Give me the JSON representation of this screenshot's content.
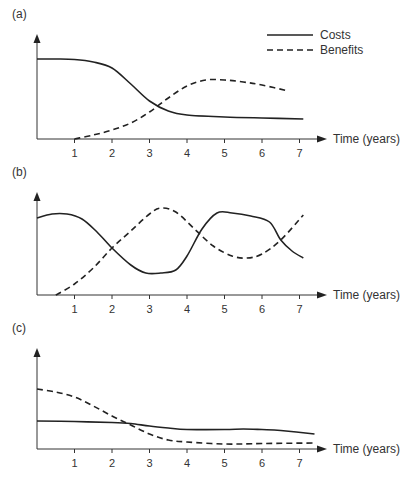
{
  "chart_data": [
    {
      "type": "line",
      "panel": "(a)",
      "xlabel": "Time (years)",
      "ylabel": "",
      "x_ticks": [
        1,
        2,
        3,
        4,
        5,
        6,
        7
      ],
      "legend": [
        "Costs",
        "Benefits"
      ],
      "legend_position": "top-right",
      "grid": false,
      "series": [
        {
          "name": "Costs",
          "style": "solid",
          "x": [
            0,
            0.5,
            1,
            1.5,
            2,
            2.5,
            3,
            3.5,
            4,
            5,
            6,
            7.1
          ],
          "y": [
            80,
            80,
            79.5,
            77,
            71,
            55,
            38,
            28,
            24,
            22,
            21,
            20
          ]
        },
        {
          "name": "Benefits",
          "style": "dashed",
          "x": [
            1,
            1.5,
            2,
            2.5,
            3,
            3.5,
            4,
            4.5,
            5,
            5.5,
            6,
            6.7
          ],
          "y": [
            0,
            4,
            9,
            16,
            27,
            41,
            53,
            59,
            59,
            57,
            54,
            48
          ]
        }
      ]
    },
    {
      "type": "line",
      "panel": "(b)",
      "xlabel": "Time (years)",
      "ylabel": "",
      "x_ticks": [
        1,
        2,
        3,
        4,
        5,
        6,
        7
      ],
      "grid": false,
      "series": [
        {
          "name": "Costs",
          "style": "solid",
          "x": [
            0,
            0.4,
            0.8,
            1.2,
            1.6,
            2,
            2.5,
            2.9,
            3.3,
            3.7,
            4.0,
            4.4,
            4.8,
            5.2,
            5.7,
            6.2,
            6.5,
            6.8,
            7.1
          ],
          "y": [
            77,
            81,
            81,
            76,
            63,
            47,
            30,
            22,
            22,
            25,
            39,
            66,
            82,
            82,
            79,
            73,
            55,
            44,
            37
          ]
        },
        {
          "name": "Benefits",
          "style": "dashed",
          "x": [
            0.5,
            1,
            1.5,
            2,
            2.5,
            3,
            3.3,
            3.7,
            4.2,
            4.7,
            5.2,
            5.6,
            6.0,
            6.5,
            7.1
          ],
          "y": [
            0,
            11,
            27,
            47,
            64,
            81,
            87,
            83,
            66,
            49,
            39,
            37,
            41,
            55,
            80
          ]
        }
      ]
    },
    {
      "type": "line",
      "panel": "(c)",
      "xlabel": "Time (years)",
      "ylabel": "",
      "x_ticks": [
        1,
        2,
        3,
        4,
        5,
        6,
        7
      ],
      "grid": false,
      "series": [
        {
          "name": "Costs",
          "style": "solid",
          "x": [
            0,
            1,
            2,
            2.5,
            3,
            3.5,
            4,
            5,
            5.5,
            6,
            6.5,
            7.4
          ],
          "y": [
            28,
            27.5,
            26.5,
            25.5,
            23,
            21,
            19.5,
            19.5,
            20,
            19.5,
            18.5,
            15
          ]
        },
        {
          "name": "Benefits",
          "style": "dashed",
          "x": [
            0,
            0.5,
            1,
            1.5,
            2,
            2.5,
            3,
            3.5,
            4,
            5,
            6,
            7.4
          ],
          "y": [
            60,
            57,
            52,
            43,
            33,
            24,
            15,
            9,
            7,
            5,
            5.5,
            6
          ]
        }
      ]
    }
  ],
  "panels": [
    {
      "label": "(a)"
    },
    {
      "label": "(b)"
    },
    {
      "label": "(c)"
    }
  ],
  "legend": {
    "costs": "Costs",
    "benefits": "Benefits"
  },
  "axis": {
    "xlabel": "Time (years)",
    "ticks": [
      "1",
      "2",
      "3",
      "4",
      "5",
      "6",
      "7"
    ]
  }
}
